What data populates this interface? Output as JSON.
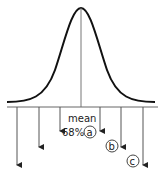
{
  "diagram": {
    "type": "normal-distribution",
    "mean_label": "mean",
    "percent_label": "68%",
    "markers": [
      {
        "id": "a",
        "label": "a"
      },
      {
        "id": "b",
        "label": "b"
      },
      {
        "id": "c",
        "label": "c"
      }
    ],
    "colors": {
      "curve": "#111111",
      "line": "#555555",
      "arrow": "#222222"
    }
  }
}
